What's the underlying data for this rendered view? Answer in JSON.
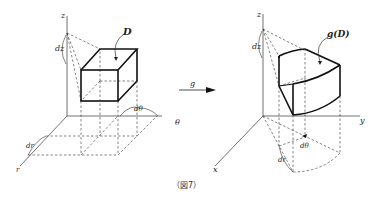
{
  "figure": {
    "caption": "（図7）",
    "left_diagram": {
      "title": "Box D in cylindrical coordinates (r, θ, z)",
      "axes": {
        "vertical": "z",
        "horizontal": "θ",
        "depth": "r"
      },
      "region_label": "D",
      "differentials": {
        "dz": "dz",
        "dtheta": "dθ",
        "dr": "dr"
      }
    },
    "mapping": {
      "label": "g"
    },
    "right_diagram": {
      "title": "Image g(D) in Cartesian coordinates (x, y, z)",
      "axes": {
        "vertical": "z",
        "horizontal": "y",
        "depth": "x"
      },
      "region_label": "g(D)",
      "differentials": {
        "dz": "dz",
        "dtheta": "dθ",
        "dr": "dr"
      }
    }
  },
  "colors": {
    "ink": "#222222",
    "dash": "#444444",
    "background": "#ffffff"
  }
}
